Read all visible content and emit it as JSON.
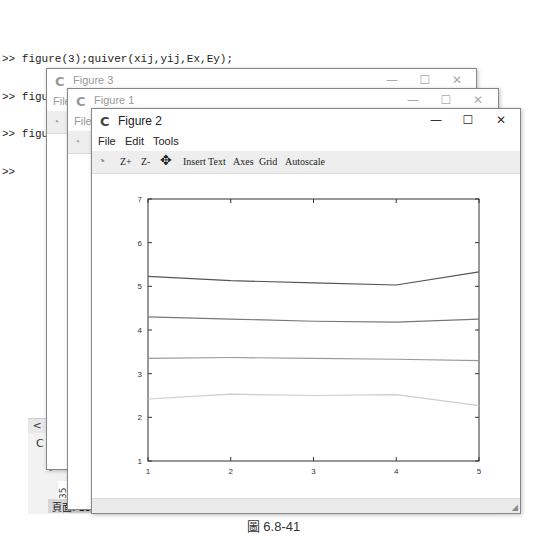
{
  "console": {
    "lines": [
      ">> figure(3);quiver(xij,yij,Ex,Ey);",
      ">> figure(1);surf(xij,yij,V);",
      ">> figure(2);contour(V,[2,4,6,8])",
      ">>"
    ]
  },
  "background_window": {
    "scroll_left": "<",
    "partial_text": "C",
    "coordinates": "(0.1",
    "vertical_text": "- 35",
    "status": "頁面: 19"
  },
  "windows": [
    {
      "title": "Figure 3",
      "menu_partial": "File",
      "state": "inactive"
    },
    {
      "title": "Figure 1",
      "menu_partial": "File",
      "state": "inactive"
    },
    {
      "title": "Figure 2",
      "state": "active",
      "menu": [
        "File",
        "Edit",
        "Tools"
      ],
      "toolbar": [
        "Z+",
        "Z-",
        "Insert Text",
        "Axes",
        "Grid",
        "Autoscale"
      ]
    }
  ],
  "window_controls": {
    "minimize": "—",
    "maximize": "☐",
    "close": "✕"
  },
  "chart_data": {
    "type": "line",
    "title": "",
    "xlabel": "",
    "ylabel": "",
    "x": [
      1,
      2,
      3,
      4,
      5
    ],
    "xlim": [
      1,
      5
    ],
    "ylim": [
      1,
      7
    ],
    "xticks": [
      "1",
      "2",
      "3",
      "4",
      "5"
    ],
    "yticks": [
      "1",
      "2",
      "3",
      "4",
      "5",
      "6",
      "7"
    ],
    "grid": false,
    "legend": null,
    "series": [
      {
        "name": "contour-1",
        "color": "#555555",
        "values": [
          5.23,
          5.13,
          5.08,
          5.03,
          5.33
        ]
      },
      {
        "name": "contour-2",
        "color": "#777777",
        "values": [
          4.3,
          4.25,
          4.2,
          4.18,
          4.25
        ]
      },
      {
        "name": "contour-3",
        "color": "#999999",
        "values": [
          3.35,
          3.37,
          3.35,
          3.33,
          3.3
        ]
      },
      {
        "name": "contour-4",
        "color": "#cccccc",
        "values": [
          2.42,
          2.53,
          2.5,
          2.52,
          2.27
        ]
      }
    ]
  },
  "caption": "圖 6.8-41"
}
